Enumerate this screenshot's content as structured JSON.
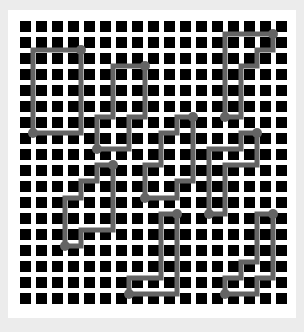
{
  "grid": {
    "cols": 17,
    "rows": 18,
    "origin_x": 20,
    "origin_y": 21,
    "pitch": 16,
    "square_size": 11,
    "square_color": "#000000",
    "background_color": "#ffffff"
  },
  "paths": {
    "stroke_color": "#646464",
    "stroke_width": 5,
    "dot_radius": 5,
    "shapes": [
      {
        "name": "path-1",
        "points": [
          [
            33,
            50
          ],
          [
            81,
            50
          ],
          [
            81,
            133
          ],
          [
            33,
            133
          ],
          [
            33,
            50
          ]
        ],
        "dots": [
          [
            81,
            50
          ],
          [
            33,
            133
          ]
        ]
      },
      {
        "name": "path-2",
        "points": [
          [
            145,
            66
          ],
          [
            113,
            66
          ],
          [
            113,
            117
          ],
          [
            97,
            117
          ],
          [
            97,
            149
          ],
          [
            129,
            149
          ],
          [
            129,
            117
          ],
          [
            145,
            117
          ],
          [
            145,
            66
          ]
        ],
        "dots": [
          [
            145,
            66
          ],
          [
            97,
            149
          ]
        ]
      },
      {
        "name": "path-3",
        "points": [
          [
            193,
            117
          ],
          [
            177,
            117
          ],
          [
            177,
            133
          ],
          [
            161,
            133
          ],
          [
            161,
            165
          ],
          [
            145,
            165
          ],
          [
            145,
            198
          ],
          [
            177,
            198
          ],
          [
            177,
            181
          ],
          [
            193,
            181
          ],
          [
            193,
            117
          ]
        ],
        "dots": [
          [
            193,
            117
          ],
          [
            145,
            198
          ]
        ]
      },
      {
        "name": "path-4",
        "points": [
          [
            273,
            34
          ],
          [
            225,
            34
          ],
          [
            225,
            117
          ],
          [
            241,
            117
          ],
          [
            241,
            66
          ],
          [
            257,
            66
          ],
          [
            257,
            50
          ],
          [
            273,
            50
          ],
          [
            273,
            34
          ]
        ],
        "dots": [
          [
            273,
            34
          ],
          [
            225,
            117
          ]
        ]
      },
      {
        "name": "path-5",
        "points": [
          [
            113,
            165
          ],
          [
            97,
            165
          ],
          [
            97,
            181
          ],
          [
            81,
            181
          ],
          [
            81,
            198
          ],
          [
            65,
            198
          ],
          [
            65,
            246
          ],
          [
            81,
            246
          ],
          [
            81,
            230
          ],
          [
            113,
            230
          ],
          [
            113,
            165
          ]
        ],
        "dots": [
          [
            113,
            165
          ],
          [
            65,
            246
          ]
        ]
      },
      {
        "name": "path-6",
        "points": [
          [
            257,
            133
          ],
          [
            241,
            133
          ],
          [
            241,
            149
          ],
          [
            209,
            149
          ],
          [
            209,
            214
          ],
          [
            225,
            214
          ],
          [
            225,
            165
          ],
          [
            257,
            165
          ],
          [
            257,
            133
          ]
        ],
        "dots": [
          [
            257,
            133
          ],
          [
            209,
            214
          ]
        ]
      },
      {
        "name": "path-7",
        "points": [
          [
            177,
            214
          ],
          [
            161,
            214
          ],
          [
            161,
            278
          ],
          [
            129,
            278
          ],
          [
            129,
            294
          ],
          [
            177,
            294
          ],
          [
            177,
            214
          ]
        ],
        "dots": [
          [
            177,
            214
          ],
          [
            129,
            294
          ]
        ]
      },
      {
        "name": "path-8",
        "points": [
          [
            273,
            214
          ],
          [
            257,
            214
          ],
          [
            257,
            262
          ],
          [
            241,
            262
          ],
          [
            241,
            278
          ],
          [
            225,
            278
          ],
          [
            225,
            294
          ],
          [
            257,
            294
          ],
          [
            257,
            278
          ],
          [
            273,
            278
          ],
          [
            273,
            214
          ]
        ],
        "dots": [
          [
            273,
            214
          ],
          [
            225,
            294
          ]
        ]
      }
    ]
  }
}
